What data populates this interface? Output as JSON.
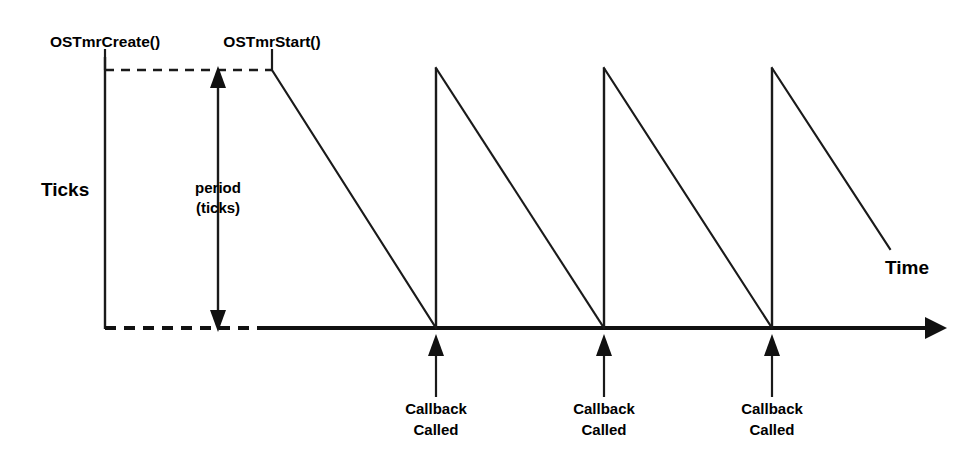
{
  "diagram": {
    "axis": {
      "y_label": "Ticks",
      "x_label": "Time"
    },
    "events": {
      "create_label": "OSTmrCreate()",
      "start_label": "OSTmrStart()"
    },
    "period": {
      "line1": "period",
      "line2": "(ticks)"
    },
    "callbacks": [
      {
        "line1": "Callback",
        "line2": "Called"
      },
      {
        "line1": "Callback",
        "line2": "Called"
      },
      {
        "line1": "Callback",
        "line2": "Called"
      }
    ],
    "colors": {
      "ink": "#1a1a1a",
      "background": "#ffffff"
    }
  }
}
